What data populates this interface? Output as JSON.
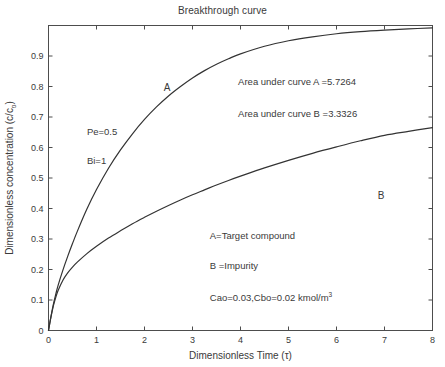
{
  "chart_data": {
    "type": "line",
    "title": "Breakthrough curve",
    "xlabel": "Dimensionless Time (τ)",
    "ylabel_prefix": "Dimensionless concentration (c/c",
    "ylabel_sub": "o",
    "ylabel_suffix": ")",
    "xlim": [
      0,
      8
    ],
    "ylim": [
      0,
      1
    ],
    "grid": false,
    "legend_position": "none",
    "xticks": [
      "0",
      "1",
      "2",
      "3",
      "4",
      "5",
      "6",
      "7",
      "8"
    ],
    "yticks": [
      "0",
      "0.1",
      "0.2",
      "0.3",
      "0.4",
      "0.5",
      "0.6",
      "0.7",
      "0.8",
      "0.9"
    ],
    "xtick_values": [
      0,
      1,
      2,
      3,
      4,
      5,
      6,
      7,
      8
    ],
    "ytick_values": [
      0,
      0.1,
      0.2,
      0.3,
      0.4,
      0.5,
      0.6,
      0.7,
      0.8,
      0.9
    ],
    "series": [
      {
        "name": "A",
        "label": "A",
        "color": "#333333",
        "x": [
          0,
          0.05,
          0.1,
          0.15,
          0.2,
          0.3,
          0.4,
          0.5,
          0.6,
          0.8,
          1.0,
          1.25,
          1.5,
          1.75,
          2.0,
          2.25,
          2.5,
          2.75,
          3.0,
          3.25,
          3.5,
          3.75,
          4.0,
          4.5,
          5.0,
          5.5,
          6.0,
          6.5,
          7.0,
          7.5,
          8.0
        ],
        "values": [
          0,
          0.045,
          0.085,
          0.118,
          0.148,
          0.198,
          0.243,
          0.285,
          0.325,
          0.398,
          0.462,
          0.532,
          0.592,
          0.645,
          0.692,
          0.733,
          0.769,
          0.8,
          0.828,
          0.852,
          0.873,
          0.891,
          0.907,
          0.932,
          0.95,
          0.963,
          0.973,
          0.98,
          0.985,
          0.989,
          0.992
        ]
      },
      {
        "name": "B",
        "label": "B",
        "color": "#333333",
        "x": [
          0,
          0.05,
          0.1,
          0.15,
          0.2,
          0.3,
          0.4,
          0.5,
          0.6,
          0.8,
          1.0,
          1.25,
          1.5,
          1.75,
          2.0,
          2.25,
          2.5,
          2.75,
          3.0,
          3.25,
          3.5,
          3.75,
          4.0,
          4.5,
          5.0,
          5.5,
          6.0,
          6.5,
          7.0,
          7.5,
          8.0
        ],
        "values": [
          0,
          0.043,
          0.08,
          0.108,
          0.131,
          0.165,
          0.189,
          0.208,
          0.224,
          0.252,
          0.276,
          0.303,
          0.327,
          0.35,
          0.371,
          0.391,
          0.41,
          0.428,
          0.445,
          0.461,
          0.477,
          0.492,
          0.506,
          0.533,
          0.558,
          0.581,
          0.602,
          0.622,
          0.64,
          0.653,
          0.665
        ]
      }
    ],
    "curve_labels": [
      {
        "text": "A",
        "x": 2.47,
        "y": 0.785
      },
      {
        "text": "B",
        "x": 6.93,
        "y": 0.432
      }
    ],
    "annotations": [
      {
        "name": "area-a",
        "text": "Area under curve A =5.7264",
        "x": 3.95,
        "y": 0.805
      },
      {
        "name": "area-b",
        "text": "Area under curve B =3.3326",
        "x": 3.95,
        "y": 0.7
      },
      {
        "name": "pe",
        "text": "Pe=0.5",
        "x": 0.8,
        "y": 0.64
      },
      {
        "name": "bi",
        "text": "Bi=1",
        "x": 0.8,
        "y": 0.545
      },
      {
        "name": "target-compound",
        "text": "A=Target compound",
        "x": 3.36,
        "y": 0.3
      },
      {
        "name": "impurity",
        "text": "B =Impurity",
        "x": 3.36,
        "y": 0.203
      },
      {
        "name": "concentrations",
        "text": "Cao=0.03,Cbo=0.02 kmol/m",
        "superscript": "3",
        "x": 3.36,
        "y": 0.098
      }
    ]
  }
}
